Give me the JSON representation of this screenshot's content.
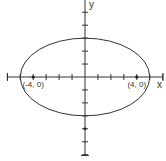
{
  "diagram": {
    "type": "ellipse-graph",
    "axes": {
      "x_label": "x",
      "y_label": "y",
      "x_ticks": [
        -6,
        -5,
        -4,
        -3,
        -2,
        -1,
        1,
        2,
        3,
        4,
        5,
        6
      ],
      "y_ticks": [
        5,
        4,
        3,
        2,
        1,
        -1,
        -2,
        -3,
        -4,
        -5,
        -6
      ]
    },
    "ellipse": {
      "center": [
        0,
        0
      ],
      "semi_major_x": 5,
      "semi_minor_y": 3
    },
    "points": [
      {
        "label": "(-4, 0)",
        "x": -4,
        "y": 0
      },
      {
        "label": "(4, 0)",
        "x": 4,
        "y": 0
      }
    ],
    "extra_marked_points": [
      {
        "x": 0,
        "y": -4
      }
    ],
    "colors": {
      "line": "#333333",
      "background": "#ffffff"
    }
  }
}
